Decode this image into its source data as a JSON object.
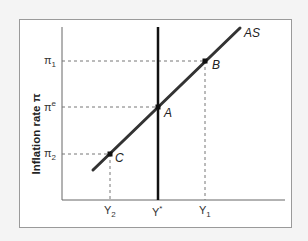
{
  "diagram": {
    "title": "",
    "y_axis_label": "Inflation rate π",
    "y_ticks": [
      {
        "base": "π",
        "sub": "1",
        "sup": ""
      },
      {
        "base": "π",
        "sub": "",
        "sup": "e"
      },
      {
        "base": "π",
        "sub": "2",
        "sup": ""
      }
    ],
    "x_ticks": [
      {
        "base": "Y",
        "sub": "2",
        "sup": ""
      },
      {
        "base": "Y",
        "sub": "",
        "sup": "*"
      },
      {
        "base": "Y",
        "sub": "1",
        "sup": ""
      }
    ],
    "curve_label": "AS",
    "points": [
      {
        "label": "A"
      },
      {
        "label": "B"
      },
      {
        "label": "C"
      }
    ],
    "colors": {
      "background": "#f4f4f4",
      "panel": "#ffffff",
      "border": "#9a9a9a",
      "axis": "#555555",
      "as_curve": "#333333",
      "y_star_line": "#111111",
      "dashed": "#777777"
    }
  }
}
